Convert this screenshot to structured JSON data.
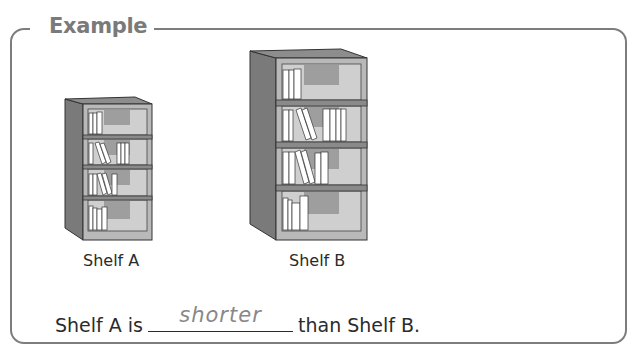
{
  "example": {
    "title": "Example"
  },
  "shelves": [
    {
      "label": "Shelf A",
      "size": "short"
    },
    {
      "label": "Shelf B",
      "size": "tall"
    }
  ],
  "sentence": {
    "prefix": "Shelf A is",
    "answer": "shorter",
    "suffix": "than Shelf B."
  },
  "colors": {
    "frame": "#7d7d7d",
    "title": "#7a7a7a",
    "answer": "#888888",
    "shelf_side": "#7a7a7a",
    "shelf_front": "#b5b5b5",
    "shelf_inner": "#a8a8a8"
  }
}
